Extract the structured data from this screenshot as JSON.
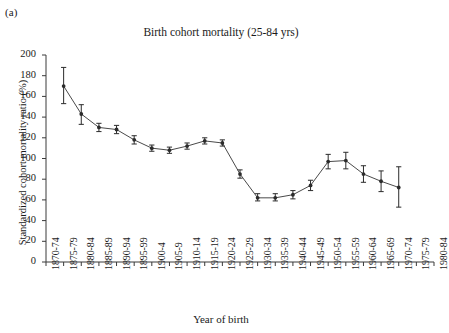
{
  "panel_label": "(a)",
  "axis_titles": {
    "y": "Standardized cohort mortality ratio (%)",
    "x": "Year of birth"
  },
  "chart_data": {
    "type": "line",
    "title": "Birth cohort mortality (25-84 yrs)",
    "xlabel": "Year of birth",
    "ylabel": "Standardized cohort mortality ratio (%)",
    "ylim": [
      0,
      200
    ],
    "ytick_labels": [
      "0",
      "20",
      "40",
      "60",
      "80",
      "100",
      "120",
      "140",
      "160",
      "180",
      "200"
    ],
    "yticks": [
      0,
      20,
      40,
      60,
      80,
      100,
      120,
      140,
      160,
      180,
      200
    ],
    "grid": false,
    "legend": null,
    "categories": [
      "1870-74",
      "1875-79",
      "1880-84",
      "1885-89",
      "1890-94",
      "1895-99",
      "1900-4",
      "1905-9",
      "1910-14",
      "1915-19",
      "1920-24",
      "1925-29",
      "1930-34",
      "1935-39",
      "1940-44",
      "1945-49",
      "1950-54",
      "1955-59",
      "1960-64",
      "1965-69",
      "1970-74",
      "1975-79",
      "1980-84"
    ],
    "series": [
      {
        "name": "Standardized cohort mortality ratio",
        "marker": "filled-circle-with-error-bars",
        "points": [
          {
            "x": "1870-74",
            "y": null,
            "lo": null,
            "hi": null
          },
          {
            "x": "1875-79",
            "y": 170,
            "lo": 153,
            "hi": 188
          },
          {
            "x": "1880-84",
            "y": 143,
            "lo": 133,
            "hi": 152
          },
          {
            "x": "1885-89",
            "y": 130,
            "lo": 126,
            "hi": 134
          },
          {
            "x": "1890-94",
            "y": 128,
            "lo": 124,
            "hi": 132
          },
          {
            "x": "1895-99",
            "y": 118,
            "lo": 114,
            "hi": 122
          },
          {
            "x": "1900-4",
            "y": 110,
            "lo": 107,
            "hi": 113
          },
          {
            "x": "1905-9",
            "y": 108,
            "lo": 105,
            "hi": 111
          },
          {
            "x": "1910-14",
            "y": 112,
            "lo": 109,
            "hi": 115
          },
          {
            "x": "1915-19",
            "y": 117,
            "lo": 114,
            "hi": 120
          },
          {
            "x": "1920-24",
            "y": 115,
            "lo": 112,
            "hi": 118
          },
          {
            "x": "1925-29",
            "y": 85,
            "lo": 81,
            "hi": 89
          },
          {
            "x": "1930-34",
            "y": 62,
            "lo": 59,
            "hi": 66
          },
          {
            "x": "1935-39",
            "y": 62,
            "lo": 59,
            "hi": 66
          },
          {
            "x": "1940-44",
            "y": 65,
            "lo": 61,
            "hi": 69
          },
          {
            "x": "1945-49",
            "y": 74,
            "lo": 69,
            "hi": 79
          },
          {
            "x": "1950-54",
            "y": 97,
            "lo": 90,
            "hi": 104
          },
          {
            "x": "1955-59",
            "y": 98,
            "lo": 90,
            "hi": 106
          },
          {
            "x": "1960-64",
            "y": 85,
            "lo": 77,
            "hi": 93
          },
          {
            "x": "1965-69",
            "y": 78,
            "lo": 68,
            "hi": 88
          },
          {
            "x": "1970-74",
            "y": 72,
            "lo": 53,
            "hi": 92
          },
          {
            "x": "1975-79",
            "y": null,
            "lo": null,
            "hi": null
          },
          {
            "x": "1980-84",
            "y": null,
            "lo": null,
            "hi": null
          }
        ]
      }
    ]
  },
  "colors": {
    "axis": "#3a3a3a",
    "line": "#4a4a4a",
    "marker": "#2b2b2b",
    "text": "#1a1a1a",
    "background": "#ffffff"
  }
}
